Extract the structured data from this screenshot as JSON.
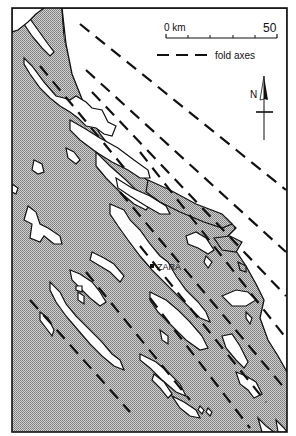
{
  "map": {
    "scale_bar": {
      "start_label": "0 km",
      "end_label": "50",
      "ticks": 5
    },
    "legend": {
      "fold_axes_label": "fold axes",
      "line_style": "dashed"
    },
    "north_arrow": {
      "label": "N"
    },
    "places": [
      {
        "name": "ZARA",
        "marker": "square"
      }
    ],
    "colors": {
      "sea": "#b4b4b4",
      "land": "#ffffff",
      "outline": "#111111"
    },
    "legend_keys": {
      "stippled": "sea",
      "white": "land"
    }
  }
}
